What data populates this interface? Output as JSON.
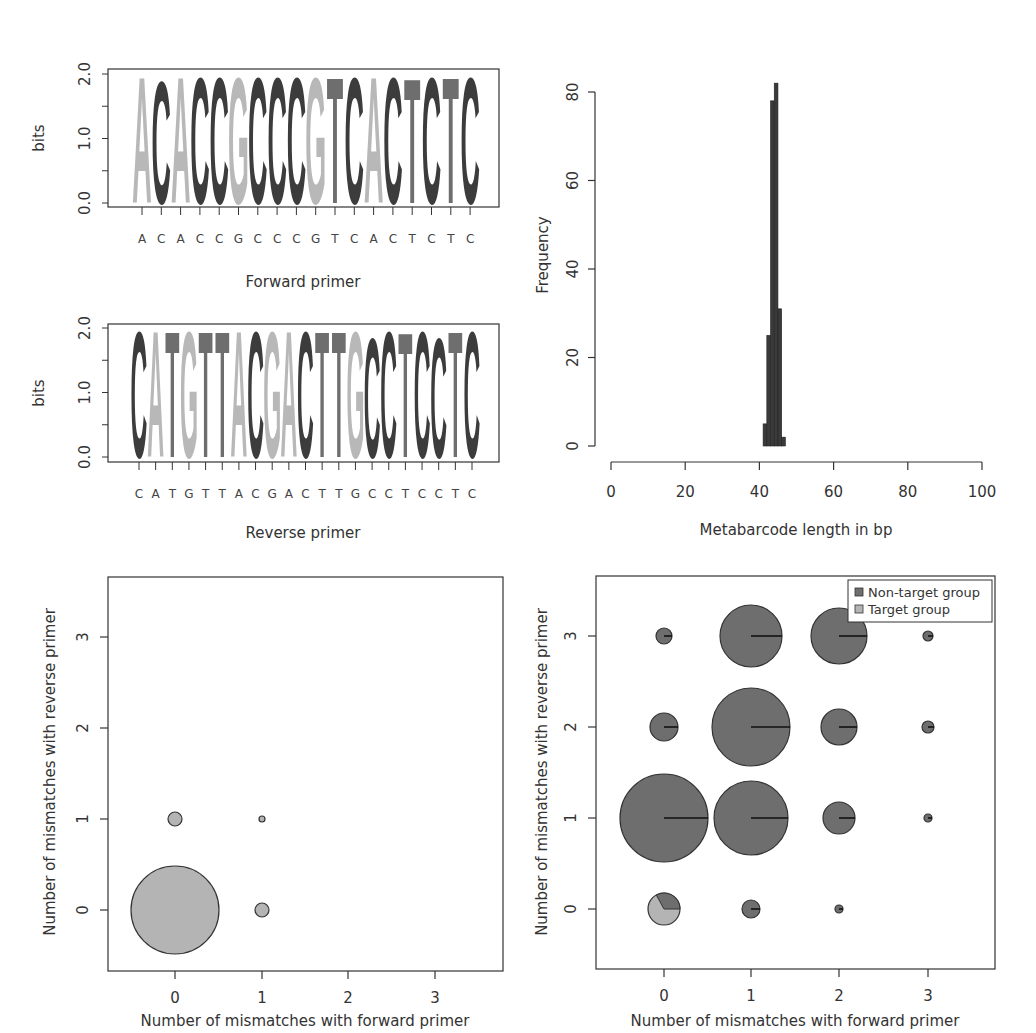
{
  "colors": {
    "A": "#b8b8b8",
    "C": "#3c3c3c",
    "G": "#b8b8b8",
    "T": "#6e6e6e",
    "non_target": "#6e6e6e",
    "target": "#b4b4b4",
    "axis": "#333333"
  },
  "chart_data": [
    {
      "id": "forward-logo",
      "type": "sequence-logo",
      "xlabel": "Forward primer",
      "ylabel": "bits",
      "ylim": [
        0,
        2
      ],
      "yticks": [
        "0.0",
        "1.0",
        "2.0"
      ],
      "sequence": [
        "A",
        "C",
        "A",
        "C",
        "C",
        "G",
        "C",
        "C",
        "C",
        "G",
        "T",
        "C",
        "A",
        "C",
        "T",
        "C",
        "T",
        "C"
      ],
      "heights": [
        2.0,
        1.95,
        2.0,
        2.0,
        2.0,
        2.0,
        2.0,
        2.0,
        2.0,
        2.0,
        2.0,
        2.0,
        2.0,
        2.0,
        1.98,
        2.0,
        2.0,
        2.0
      ]
    },
    {
      "id": "reverse-logo",
      "type": "sequence-logo",
      "xlabel": "Reverse primer",
      "ylabel": "bits",
      "ylim": [
        0,
        2
      ],
      "yticks": [
        "0.0",
        "1.0",
        "2.0"
      ],
      "sequence": [
        "C",
        "A",
        "T",
        "G",
        "T",
        "T",
        "A",
        "C",
        "G",
        "A",
        "C",
        "T",
        "T",
        "G",
        "C",
        "C",
        "T",
        "C",
        "C",
        "T",
        "C"
      ],
      "heights": [
        2.0,
        2.0,
        2.0,
        2.0,
        2.0,
        2.0,
        2.0,
        2.0,
        2.0,
        2.0,
        2.0,
        2.0,
        2.0,
        2.0,
        1.9,
        2.0,
        1.98,
        2.0,
        1.9,
        2.0,
        2.0
      ]
    },
    {
      "id": "length-histogram",
      "type": "bar",
      "xlabel": "Metabarcode length in bp",
      "ylabel": "Frequency",
      "xlim": [
        0,
        100
      ],
      "ylim": [
        0,
        80
      ],
      "xticks": [
        "0",
        "20",
        "40",
        "60",
        "80",
        "100"
      ],
      "yticks": [
        "0",
        "20",
        "40",
        "60",
        "80"
      ],
      "categories": [
        41,
        42,
        43,
        44,
        45,
        46
      ],
      "values": [
        5,
        25,
        78,
        82,
        31,
        2
      ]
    },
    {
      "id": "mismatch-target",
      "type": "scatter",
      "xlabel": "Number of mismatches with forward primer",
      "ylabel": "Number of mismatches with reverse primer",
      "xticks": [
        "0",
        "1",
        "2",
        "3"
      ],
      "yticks": [
        "0",
        "1",
        "2",
        "3"
      ],
      "points": [
        {
          "x": 0,
          "y": 0,
          "r": 44,
          "target_frac": 1.0
        },
        {
          "x": 0,
          "y": 1,
          "r": 7,
          "target_frac": 1.0
        },
        {
          "x": 1,
          "y": 0,
          "r": 7,
          "target_frac": 1.0
        },
        {
          "x": 1,
          "y": 1,
          "r": 3,
          "target_frac": 1.0
        }
      ]
    },
    {
      "id": "mismatch-all",
      "type": "scatter",
      "xlabel": "Number of mismatches with forward primer",
      "ylabel": "Number of mismatches with reverse primer",
      "xticks": [
        "0",
        "1",
        "2",
        "3"
      ],
      "yticks": [
        "0",
        "1",
        "2",
        "3"
      ],
      "legend": [
        {
          "label": "Non-target group",
          "color": "#6e6e6e"
        },
        {
          "label": "Target group",
          "color": "#b4b4b4"
        }
      ],
      "legend_position": "top-right",
      "points": [
        {
          "x": 0,
          "y": 0,
          "r": 16,
          "target_frac": 0.67
        },
        {
          "x": 1,
          "y": 0,
          "r": 9,
          "target_frac": 0.0
        },
        {
          "x": 2,
          "y": 0,
          "r": 4,
          "target_frac": 0.0
        },
        {
          "x": 0,
          "y": 1,
          "r": 44,
          "target_frac": 0.0
        },
        {
          "x": 1,
          "y": 1,
          "r": 37,
          "target_frac": 0.0
        },
        {
          "x": 2,
          "y": 1,
          "r": 16,
          "target_frac": 0.0
        },
        {
          "x": 3,
          "y": 1,
          "r": 4,
          "target_frac": 0.0
        },
        {
          "x": 0,
          "y": 2,
          "r": 14,
          "target_frac": 0.0
        },
        {
          "x": 1,
          "y": 2,
          "r": 39,
          "target_frac": 0.0
        },
        {
          "x": 2,
          "y": 2,
          "r": 18,
          "target_frac": 0.0
        },
        {
          "x": 3,
          "y": 2,
          "r": 6,
          "target_frac": 0.0
        },
        {
          "x": 0,
          "y": 3,
          "r": 8,
          "target_frac": 0.0
        },
        {
          "x": 1,
          "y": 3,
          "r": 31,
          "target_frac": 0.0
        },
        {
          "x": 2,
          "y": 3,
          "r": 28,
          "target_frac": 0.0
        },
        {
          "x": 3,
          "y": 3,
          "r": 5,
          "target_frac": 0.0
        }
      ]
    }
  ],
  "labels": {
    "fwd_xlabel": "Forward primer",
    "rev_xlabel": "Reverse primer",
    "bits": "bits",
    "hist_xlabel": "Metabarcode length in bp",
    "hist_ylabel": "Frequency",
    "mm_xlabel": "Number of mismatches with forward primer",
    "mm_ylabel": "Number of mismatches with reverse primer",
    "legend_nontarget": "Non-target group",
    "legend_target": "Target group"
  }
}
